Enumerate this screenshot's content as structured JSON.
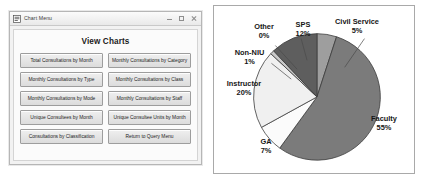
{
  "window": {
    "title": "Chart Menu",
    "icon": "form-window-icon",
    "controls": [
      {
        "name": "minimize",
        "glyph": "minimize-icon"
      },
      {
        "name": "maximize",
        "glyph": "maximize-icon"
      },
      {
        "name": "close",
        "glyph": "close-icon"
      }
    ]
  },
  "form": {
    "heading": "View Charts",
    "buttons": [
      "Total Consultations by Month",
      "Monthly Consultations by Category",
      "Monthly Consultations by Type",
      "Monthly Consultations by Class",
      "Monthly Consultations by Mode",
      "Monthly Consultations by Staff",
      "Unique Consultees by Month",
      "Unique Consultee Units by Month",
      "Consultations by Classification",
      "Return to Query Menu"
    ]
  },
  "chart_data": {
    "type": "pie",
    "title": "",
    "labels": [
      "Civil Service",
      "Faculty",
      "GA",
      "Instructor",
      "Non-NIU",
      "SPS",
      "Other"
    ],
    "values": [
      5,
      55,
      7,
      20,
      1,
      12,
      0
    ],
    "value_suffix": "%",
    "data_labels": [
      "5%",
      "55%",
      "7%",
      "20%",
      "1%",
      "12%",
      "0%"
    ],
    "colors": [
      "#9e9e9e",
      "#7b7b7b",
      "#fbfbfb",
      "#f0f0f0",
      "#c9c9c9",
      "#5e5e5e",
      "#808080"
    ],
    "legend": "none",
    "grid": false,
    "start_angle_deg": 0
  },
  "colors": {
    "window_bg": "#f2f2f2",
    "button_face": "#e4e4e4",
    "text": "#1c1c1c",
    "frame_border": "#a9a9a9"
  }
}
